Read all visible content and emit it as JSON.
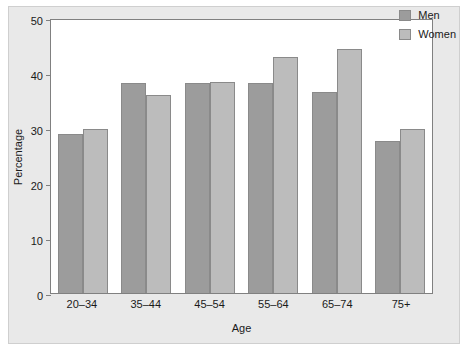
{
  "chart_data": {
    "type": "bar",
    "title": "",
    "xlabel": "Age",
    "ylabel": "Percentage",
    "categories": [
      "20–34",
      "35–44",
      "45–54",
      "55–64",
      "65–74",
      "75+"
    ],
    "series": [
      {
        "name": "Men",
        "color": "#9c9c9c",
        "values": [
          28.9,
          38.1,
          38.2,
          38.1,
          36.6,
          27.6
        ]
      },
      {
        "name": "Women",
        "color": "#bcbcbc",
        "values": [
          29.9,
          36.0,
          38.3,
          42.9,
          44.3,
          29.9
        ]
      }
    ],
    "ylim": [
      0,
      50
    ],
    "yticks": [
      0,
      10,
      20,
      30,
      40,
      50
    ],
    "grid": false,
    "legend_position": "top-right"
  },
  "figure": {
    "ghost_text": "Prevalence of Obesity by Sex and Age",
    "background_color": "#e9e9e9",
    "plot_background_color": "#ffffff",
    "axis_color": "#808080"
  }
}
